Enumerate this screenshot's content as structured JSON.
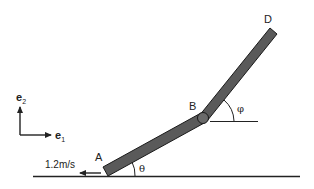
{
  "diagram": {
    "points": {
      "A": "A",
      "B": "B",
      "D": "D"
    },
    "angles": {
      "theta": "θ",
      "phi": "φ"
    },
    "velocity": {
      "label": "1.2m/s",
      "direction": "left"
    },
    "axes": {
      "e1": {
        "base": "e",
        "sub": "1"
      },
      "e2": {
        "base": "e",
        "sub": "2"
      }
    },
    "colors": {
      "bar_fill": "#5a5a5a",
      "bar_stroke": "#1a1a1a",
      "line": "#222222",
      "joint_fill": "#6a6a6a"
    }
  }
}
